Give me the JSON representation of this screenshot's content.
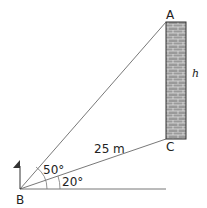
{
  "diagram": {
    "points": {
      "A": "A",
      "B": "B",
      "C": "C"
    },
    "height_label": "h",
    "distance_label": "25 m",
    "angle_elevation_A": "50°",
    "angle_elevation_C": "20°"
  }
}
